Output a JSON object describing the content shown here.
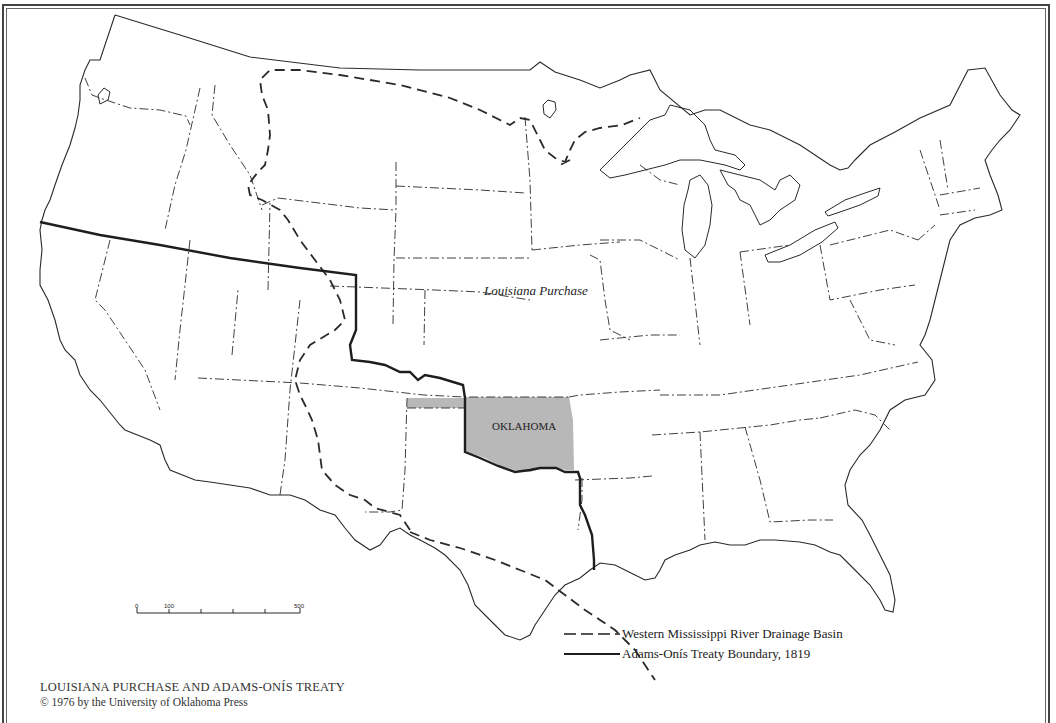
{
  "map": {
    "region_label": "Louisiana Purchase",
    "highlighted_state": {
      "label": "OKLAHOMA",
      "fill": "#b8b8b8"
    },
    "colors": {
      "ink": "#2a2a2a",
      "border": "#444444",
      "background": "#ffffff"
    }
  },
  "scale_bar": {
    "ticks": [
      "0",
      "100",
      "500"
    ]
  },
  "legend": {
    "items": [
      {
        "symbol": "dashed-line",
        "label": "Western Mississippi River Drainage Basin"
      },
      {
        "symbol": "solid-heavy-line",
        "label": "Adams-Onís Treaty Boundary, 1819"
      }
    ]
  },
  "caption": {
    "title": "LOUISIANA PURCHASE AND ADAMS-ONÍS TREATY",
    "copyright": "© 1976 by the University of Oklahoma Press"
  }
}
